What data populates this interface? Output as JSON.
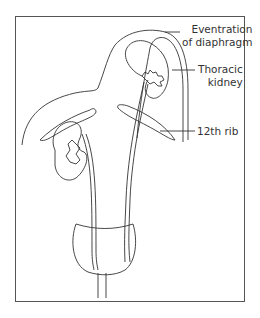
{
  "figure": {
    "labels": {
      "eventration_line1": "Eventration",
      "eventration_line2": "of diaphragm",
      "thoracic_line1": "Thoracic",
      "thoracic_line2": "kidney",
      "rib": "12th rib"
    },
    "colors": {
      "line": "#333333",
      "frame": "#555555",
      "background": "#ffffff"
    }
  }
}
